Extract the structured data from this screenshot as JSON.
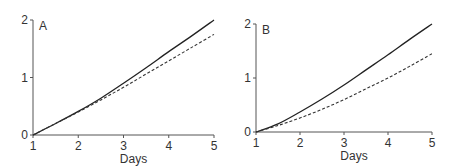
{
  "chart_data": [
    {
      "type": "line",
      "panel_label": "A",
      "title": "",
      "xlabel": "Days",
      "ylabel": "",
      "xlim": [
        1,
        5
      ],
      "ylim": [
        0,
        2
      ],
      "xticks": [
        1,
        2,
        3,
        4,
        5
      ],
      "yticks": [
        0,
        1,
        2
      ],
      "grid": false,
      "legend": null,
      "x": [
        1,
        1.5,
        2,
        2.5,
        3,
        3.5,
        4,
        4.5,
        5
      ],
      "series": [
        {
          "name": "solid",
          "style": "solid",
          "values": [
            0,
            0.2,
            0.41,
            0.64,
            0.9,
            1.17,
            1.45,
            1.72,
            2.0
          ]
        },
        {
          "name": "dashed",
          "style": "dashed",
          "values": [
            0,
            0.2,
            0.4,
            0.61,
            0.83,
            1.06,
            1.29,
            1.52,
            1.75
          ]
        }
      ]
    },
    {
      "type": "line",
      "panel_label": "B",
      "title": "",
      "xlabel": "Days",
      "ylabel": "",
      "xlim": [
        1,
        5
      ],
      "ylim": [
        0,
        2
      ],
      "xticks": [
        1,
        2,
        3,
        4,
        5
      ],
      "yticks": [
        0,
        1,
        2
      ],
      "grid": false,
      "legend": null,
      "x": [
        1,
        1.5,
        2,
        2.5,
        3,
        3.5,
        4,
        4.5,
        5
      ],
      "series": [
        {
          "name": "solid",
          "style": "solid",
          "values": [
            0,
            0.15,
            0.37,
            0.61,
            0.87,
            1.15,
            1.43,
            1.72,
            2.0
          ]
        },
        {
          "name": "dashed",
          "style": "dashed",
          "values": [
            0,
            0.12,
            0.26,
            0.42,
            0.6,
            0.8,
            1.0,
            1.22,
            1.45
          ]
        }
      ]
    }
  ]
}
